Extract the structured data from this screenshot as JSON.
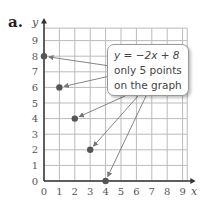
{
  "label": "a.",
  "callout": {
    "equation": "y = −2x + 8",
    "line1": "only 5 points",
    "line2": "on the graph"
  },
  "axes": {
    "xlabel": "x",
    "ylabel": "y"
  },
  "chart_data": {
    "type": "scatter",
    "title": "",
    "xlabel": "x",
    "ylabel": "y",
    "xlim": [
      0,
      9
    ],
    "ylim": [
      0,
      9
    ],
    "x_ticks": [
      "0",
      "1",
      "2",
      "3",
      "4",
      "5",
      "6",
      "7",
      "8",
      "9"
    ],
    "y_ticks": [
      "0",
      "1",
      "2",
      "3",
      "4",
      "5",
      "6",
      "7",
      "8",
      "9"
    ],
    "grid": true,
    "points": [
      {
        "x": 0,
        "y": 8
      },
      {
        "x": 1,
        "y": 6
      },
      {
        "x": 2,
        "y": 4
      },
      {
        "x": 3,
        "y": 2
      },
      {
        "x": 4,
        "y": 0
      }
    ],
    "annotation": "y = −2x + 8 only 5 points on the graph"
  }
}
